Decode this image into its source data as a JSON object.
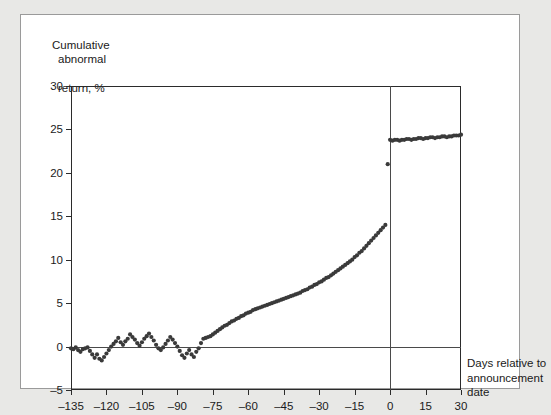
{
  "figure": {
    "y_axis_caption": [
      "Cumulative",
      "abnormal",
      "return, %"
    ],
    "x_axis_caption": [
      "Days relative to",
      "announcement",
      "date"
    ]
  },
  "chart_data": {
    "type": "scatter",
    "title": "",
    "subtitle": "",
    "xlabel": "Days relative to announcement date",
    "ylabel": "Cumulative abnormal return, %",
    "xlim": [
      -135,
      30
    ],
    "ylim": [
      -5,
      30
    ],
    "xticks": [
      -135,
      -120,
      -105,
      -90,
      -75,
      -60,
      -45,
      -30,
      -15,
      0,
      15,
      30
    ],
    "xticklabels": [
      "–135",
      "–120",
      "–105",
      "–90",
      "–75",
      "–60",
      "–45",
      "–30",
      "–15",
      "0",
      "15",
      "30"
    ],
    "yticks": [
      -5,
      0,
      5,
      10,
      15,
      20,
      25,
      30
    ],
    "yticklabels": [
      "–5",
      "0",
      "5",
      "10",
      "15",
      "20",
      "25",
      "30"
    ],
    "grid": false,
    "legend": null,
    "annotations": [
      {
        "text": "zero reference line at y = 0",
        "y": 0
      },
      {
        "text": "vertical reference line at day 0 (announcement date)",
        "x": 0
      }
    ],
    "marker": {
      "shape": "circle",
      "size": 2.1,
      "color": "#3a3a3a"
    },
    "series": [
      {
        "name": "Cumulative abnormal return",
        "x": [
          -135,
          -134,
          -133,
          -132,
          -131,
          -130,
          -129,
          -128,
          -127,
          -126,
          -125,
          -124,
          -123,
          -122,
          -121,
          -120,
          -119,
          -118,
          -117,
          -116,
          -115,
          -114,
          -113,
          -112,
          -111,
          -110,
          -109,
          -108,
          -107,
          -106,
          -105,
          -104,
          -103,
          -102,
          -101,
          -100,
          -99,
          -98,
          -97,
          -96,
          -95,
          -94,
          -93,
          -92,
          -91,
          -90,
          -89,
          -88,
          -87,
          -86,
          -85,
          -84,
          -83,
          -82,
          -81,
          -80,
          -79,
          -78,
          -77,
          -76,
          -75,
          -74,
          -73,
          -72,
          -71,
          -70,
          -69,
          -68,
          -67,
          -66,
          -65,
          -64,
          -63,
          -62,
          -61,
          -60,
          -59,
          -58,
          -57,
          -56,
          -55,
          -54,
          -53,
          -52,
          -51,
          -50,
          -49,
          -48,
          -47,
          -46,
          -45,
          -44,
          -43,
          -42,
          -41,
          -40,
          -39,
          -38,
          -37,
          -36,
          -35,
          -34,
          -33,
          -32,
          -31,
          -30,
          -29,
          -28,
          -27,
          -26,
          -25,
          -24,
          -23,
          -22,
          -21,
          -20,
          -19,
          -18,
          -17,
          -16,
          -15,
          -14,
          -13,
          -12,
          -11,
          -10,
          -9,
          -8,
          -7,
          -6,
          -5,
          -4,
          -3,
          -2,
          -1,
          0,
          1,
          2,
          3,
          4,
          5,
          6,
          7,
          8,
          9,
          10,
          11,
          12,
          13,
          14,
          15,
          16,
          17,
          18,
          19,
          20,
          21,
          22,
          23,
          24,
          25,
          26,
          27,
          28,
          29,
          30
        ],
        "y": [
          -0.2,
          -0.3,
          -0.1,
          -0.4,
          -0.6,
          -0.3,
          -0.2,
          -0.1,
          -0.5,
          -0.9,
          -1.3,
          -0.9,
          -1.4,
          -1.6,
          -1.2,
          -0.8,
          -0.4,
          0.0,
          0.3,
          0.6,
          1.0,
          0.5,
          0.2,
          0.6,
          0.9,
          1.4,
          1.1,
          0.8,
          0.4,
          0.1,
          0.5,
          0.9,
          1.2,
          1.5,
          1.1,
          0.7,
          0.2,
          -0.2,
          -0.4,
          -0.1,
          0.3,
          0.7,
          1.1,
          0.8,
          0.4,
          0.0,
          -0.5,
          -1.0,
          -1.3,
          -0.8,
          -0.4,
          -0.9,
          -1.2,
          -0.6,
          -0.2,
          0.4,
          0.9,
          1.0,
          1.1,
          1.2,
          1.4,
          1.6,
          1.8,
          2.0,
          2.2,
          2.4,
          2.5,
          2.7,
          2.9,
          3.0,
          3.2,
          3.3,
          3.5,
          3.6,
          3.8,
          3.9,
          4.0,
          4.2,
          4.3,
          4.4,
          4.5,
          4.6,
          4.7,
          4.8,
          4.9,
          5.0,
          5.1,
          5.2,
          5.3,
          5.4,
          5.5,
          5.6,
          5.7,
          5.8,
          5.9,
          6.0,
          6.1,
          6.2,
          6.4,
          6.5,
          6.6,
          6.8,
          6.9,
          7.1,
          7.2,
          7.4,
          7.5,
          7.7,
          7.9,
          8.0,
          8.2,
          8.4,
          8.6,
          8.8,
          9.0,
          9.2,
          9.4,
          9.6,
          9.8,
          10.0,
          10.3,
          10.5,
          10.8,
          11.0,
          11.3,
          11.6,
          11.9,
          12.2,
          12.5,
          12.8,
          13.1,
          13.4,
          13.7,
          14.0,
          21.0,
          23.8,
          23.7,
          23.8,
          23.8,
          23.7,
          23.8,
          23.8,
          23.9,
          23.9,
          23.8,
          23.9,
          23.9,
          24.0,
          24.0,
          23.9,
          24.0,
          24.0,
          24.1,
          24.1,
          24.0,
          24.1,
          24.1,
          24.2,
          24.2,
          24.1,
          24.2,
          24.2,
          24.3,
          24.3,
          24.3,
          24.4
        ]
      }
    ]
  }
}
